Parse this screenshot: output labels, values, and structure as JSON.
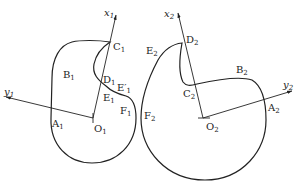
{
  "left_profile": {
    "origin": {
      "label": "O",
      "sub": "1"
    },
    "x_axis": {
      "label": "x",
      "sub": "1"
    },
    "y_axis": {
      "label": "y",
      "sub": "1"
    },
    "points": [
      {
        "id": "A1",
        "label": "A",
        "sub": "1"
      },
      {
        "id": "B1",
        "label": "B",
        "sub": "1"
      },
      {
        "id": "C1",
        "label": "C",
        "sub": "1"
      },
      {
        "id": "D1",
        "label": "D",
        "sub": "1"
      },
      {
        "id": "E1p",
        "label": "E′",
        "sub": "1"
      },
      {
        "id": "E1",
        "label": "E",
        "sub": "1"
      },
      {
        "id": "F1",
        "label": "F",
        "sub": "1"
      }
    ]
  },
  "right_profile": {
    "origin": {
      "label": "O",
      "sub": "2"
    },
    "x_axis": {
      "label": "x",
      "sub": "2"
    },
    "y_axis": {
      "label": "y",
      "sub": "2"
    },
    "points": [
      {
        "id": "A2",
        "label": "A",
        "sub": "2"
      },
      {
        "id": "B2",
        "label": "B",
        "sub": "2"
      },
      {
        "id": "C2",
        "label": "C",
        "sub": "2"
      },
      {
        "id": "D2",
        "label": "D",
        "sub": "2"
      },
      {
        "id": "E2",
        "label": "E",
        "sub": "2"
      },
      {
        "id": "F2",
        "label": "F",
        "sub": "2"
      }
    ]
  },
  "colors": {
    "stroke": "#222222",
    "background": "#ffffff"
  }
}
